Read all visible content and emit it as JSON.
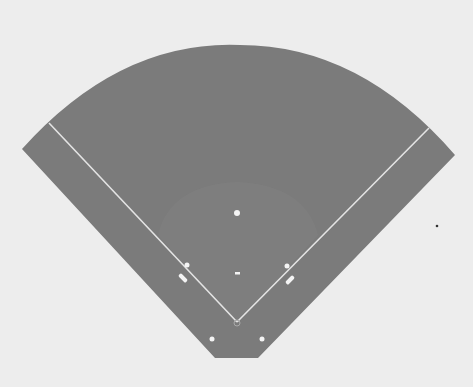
{
  "diagram": {
    "colors": {
      "background": "#ededed",
      "field": "#7b7b7b",
      "infield": "#818181",
      "lines": "#e6e6e6",
      "markers": "#f4f4f4",
      "stray_dot": "#333333"
    },
    "labels": {
      "field": "Playing field",
      "infield": "Infield arc",
      "left_foul_line": "Left foul line",
      "right_foul_line": "Right foul line",
      "home_plate": "Home plate",
      "second_base": "Second base",
      "pitchers_mound": "Pitcher's mound",
      "first_base": "First base",
      "third_base": "Third base",
      "third_base_bag": "Third base coach box",
      "first_base_bag": "First base coach box",
      "left_batter_marker": "Left marker",
      "right_batter_marker": "Right marker"
    }
  }
}
